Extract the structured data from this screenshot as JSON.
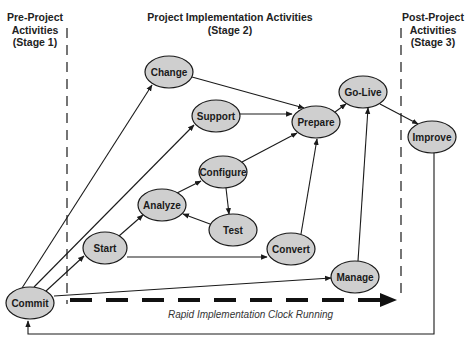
{
  "stages": [
    {
      "id": "stage1",
      "lines": [
        "Pre-Project",
        "Activities",
        "(Stage 1)"
      ]
    },
    {
      "id": "stage2",
      "lines": [
        "Project Implementation Activities",
        "(Stage 2)"
      ]
    },
    {
      "id": "stage3",
      "lines": [
        "Post-Project",
        "Activities",
        "(Stage 3)"
      ]
    }
  ],
  "nodes": [
    {
      "id": "commit",
      "label": "Commit",
      "cx": 30,
      "cy": 303,
      "rx": 24,
      "ry": 16
    },
    {
      "id": "start",
      "label": "Start",
      "cx": 105,
      "cy": 248,
      "rx": 22,
      "ry": 16
    },
    {
      "id": "change",
      "label": "Change",
      "cx": 169,
      "cy": 72,
      "rx": 24,
      "ry": 16
    },
    {
      "id": "support",
      "label": "Support",
      "cx": 216,
      "cy": 116,
      "rx": 24,
      "ry": 16
    },
    {
      "id": "analyze",
      "label": "Analyze",
      "cx": 162,
      "cy": 205,
      "rx": 24,
      "ry": 16
    },
    {
      "id": "configure",
      "label": "Configure",
      "cx": 223,
      "cy": 172,
      "rx": 24,
      "ry": 16
    },
    {
      "id": "test",
      "label": "Test",
      "cx": 233,
      "cy": 230,
      "rx": 24,
      "ry": 16
    },
    {
      "id": "convert",
      "label": "Convert",
      "cx": 291,
      "cy": 249,
      "rx": 24,
      "ry": 16
    },
    {
      "id": "prepare",
      "label": "Prepare",
      "cx": 316,
      "cy": 122,
      "rx": 24,
      "ry": 16
    },
    {
      "id": "golive",
      "label": "Go-Live",
      "cx": 363,
      "cy": 92,
      "rx": 24,
      "ry": 16
    },
    {
      "id": "manage",
      "label": "Manage",
      "cx": 355,
      "cy": 277,
      "rx": 24,
      "ry": 16
    },
    {
      "id": "improve",
      "label": "Improve",
      "cx": 432,
      "cy": 137,
      "rx": 24,
      "ry": 16
    }
  ],
  "edges": [
    {
      "from": "commit",
      "to": "change"
    },
    {
      "from": "commit",
      "to": "support"
    },
    {
      "from": "commit",
      "to": "start"
    },
    {
      "from": "commit",
      "to": "manage"
    },
    {
      "from": "start",
      "to": "analyze"
    },
    {
      "from": "start",
      "to": "convert"
    },
    {
      "from": "analyze",
      "to": "configure"
    },
    {
      "from": "configure",
      "to": "test"
    },
    {
      "from": "test",
      "to": "analyze"
    },
    {
      "from": "configure",
      "to": "prepare"
    },
    {
      "from": "change",
      "to": "prepare"
    },
    {
      "from": "support",
      "to": "prepare"
    },
    {
      "from": "convert",
      "to": "prepare"
    },
    {
      "from": "prepare",
      "to": "golive"
    },
    {
      "from": "manage",
      "to": "golive"
    },
    {
      "from": "golive",
      "to": "improve"
    },
    {
      "from": "improve",
      "to": "commit",
      "type": "feedback-loop"
    }
  ],
  "clock": {
    "label": "Rapid Implementation Clock Running"
  },
  "colors": {
    "node_fill": "#cfcfcf",
    "node_stroke": "#1a1a1a",
    "line": "#1a1a1a",
    "background": "#ffffff"
  }
}
